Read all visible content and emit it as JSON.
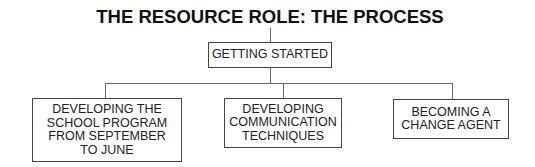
{
  "title": "THE RESOURCE ROLE: THE PROCESS",
  "root": {
    "label": "GETTING STARTED"
  },
  "children": [
    {
      "lines": [
        "DEVELOPING THE",
        "SCHOOL PROGRAM",
        "FROM SEPTEMBER",
        "TO JUNE"
      ]
    },
    {
      "lines": [
        "DEVELOPING",
        "COMMUNICATION",
        "TECHNIQUES"
      ]
    },
    {
      "lines": [
        "BECOMING A",
        "CHANGE AGENT"
      ]
    }
  ],
  "colors": {
    "text": "#222222",
    "border": "#444444",
    "connector": "#666666",
    "background": "#ffffff"
  }
}
